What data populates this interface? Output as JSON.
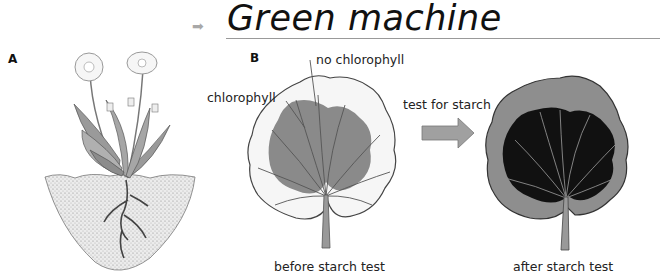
{
  "title": {
    "text": "Green machine",
    "arrow_icon": "right-arrow-icon"
  },
  "panels": {
    "a": {
      "label": "A",
      "illustration": "dandelion plant with roots in soil"
    },
    "b": {
      "label": "B",
      "labels": {
        "no_chlorophyll": "no chlorophyll",
        "chlorophyll": "chlorophyll",
        "test_for_starch": "test for starch",
        "before": "before starch test",
        "after": "after starch test"
      }
    }
  },
  "colors": {
    "leaf_green_area": "#8a8a8a",
    "leaf_pale": "#f4f4f4",
    "starch_dark": "#111111",
    "leaf_after_edge": "#8e8e8e",
    "arrow_fill": "#a0a0a0",
    "soil": "#d8d8d8"
  }
}
